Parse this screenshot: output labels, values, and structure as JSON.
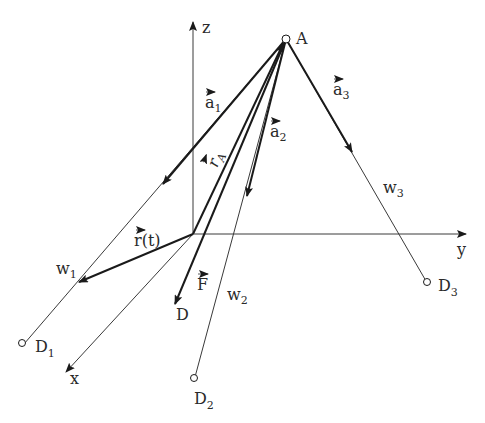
{
  "diagram": {
    "colors": {
      "line": "#1a1a1a",
      "thin": "#3a3a3a",
      "background": "#ffffff"
    },
    "axes": {
      "z": {
        "label": "z"
      },
      "y": {
        "label": "y"
      },
      "x": {
        "label": "x"
      }
    },
    "points": {
      "A": {
        "label": "A"
      },
      "D": {
        "label": "D"
      },
      "D1": {
        "label": "D",
        "sub": "1"
      },
      "D2": {
        "label": "D",
        "sub": "2"
      },
      "D3": {
        "label": "D",
        "sub": "3"
      }
    },
    "vectors": {
      "a1": {
        "label": "a",
        "sub": "1"
      },
      "a2": {
        "label": "a",
        "sub": "2"
      },
      "a3": {
        "label": "a",
        "sub": "3"
      },
      "rA": {
        "label": "r",
        "sub": "A"
      },
      "rt": {
        "label": "r(t)"
      },
      "F": {
        "label": "F"
      }
    },
    "lines": {
      "w1": {
        "label": "w",
        "sub": "1"
      },
      "w2": {
        "label": "w",
        "sub": "2"
      },
      "w3": {
        "label": "w",
        "sub": "3"
      }
    }
  }
}
